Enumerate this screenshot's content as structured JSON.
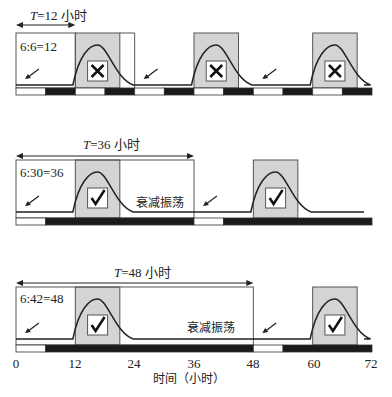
{
  "diagram": {
    "x_axis": {
      "label": "时间（小时）",
      "ticks": [
        "0",
        "12",
        "24",
        "36",
        "48",
        "60",
        "72"
      ],
      "range": [
        0,
        72
      ]
    },
    "colors": {
      "light_period": "#ffffff",
      "dark_period": "#1a1a1a",
      "flowering_window": "#d4d4d4",
      "curve": "#222222",
      "outline": "#555555"
    },
    "rows": [
      {
        "period_label_prefix": "T",
        "period_label": "=12 小时",
        "ratio": "6:6=12",
        "period_hours": 12,
        "light_dark": [
          [
            0,
            6,
            "light"
          ],
          [
            6,
            12,
            "dark"
          ],
          [
            12,
            18,
            "light"
          ],
          [
            18,
            24,
            "dark"
          ],
          [
            24,
            30,
            "light"
          ],
          [
            30,
            36,
            "dark"
          ],
          [
            36,
            42,
            "light"
          ],
          [
            42,
            48,
            "dark"
          ],
          [
            48,
            54,
            "light"
          ],
          [
            54,
            60,
            "dark"
          ],
          [
            60,
            66,
            "light"
          ],
          [
            66,
            72,
            "dark"
          ]
        ],
        "windows": [
          {
            "start": 12,
            "end": 21,
            "result": "✕",
            "result_name": "cross-icon"
          },
          {
            "start": 36,
            "end": 45,
            "result": "✕",
            "result_name": "cross-icon"
          },
          {
            "start": 60,
            "end": 69,
            "result": "✕",
            "result_name": "cross-icon"
          }
        ],
        "arrows_at": [
          2,
          26,
          50
        ],
        "note": ""
      },
      {
        "period_label_prefix": "T",
        "period_label": "=36 小时",
        "ratio": "6:30=36",
        "period_hours": 36,
        "light_dark": [
          [
            0,
            6,
            "light"
          ],
          [
            6,
            36,
            "dark"
          ],
          [
            36,
            42,
            "light"
          ],
          [
            42,
            72,
            "dark"
          ]
        ],
        "windows": [
          {
            "start": 12,
            "end": 21,
            "result": "✓",
            "result_name": "check-icon"
          },
          {
            "start": 48,
            "end": 57,
            "result": "✓",
            "result_name": "check-icon"
          }
        ],
        "arrows_at": [
          2,
          38
        ],
        "note": "衰减振荡"
      },
      {
        "period_label_prefix": "T",
        "period_label": "=48 小时",
        "ratio": "6:42=48",
        "period_hours": 48,
        "light_dark": [
          [
            0,
            6,
            "light"
          ],
          [
            6,
            48,
            "dark"
          ],
          [
            48,
            54,
            "light"
          ],
          [
            54,
            72,
            "dark"
          ]
        ],
        "windows": [
          {
            "start": 12,
            "end": 21,
            "result": "✓",
            "result_name": "check-icon"
          },
          {
            "start": 60,
            "end": 69,
            "result": "✓",
            "result_name": "check-icon"
          }
        ],
        "arrows_at": [
          2,
          50
        ],
        "note": "衰减振荡"
      }
    ]
  }
}
